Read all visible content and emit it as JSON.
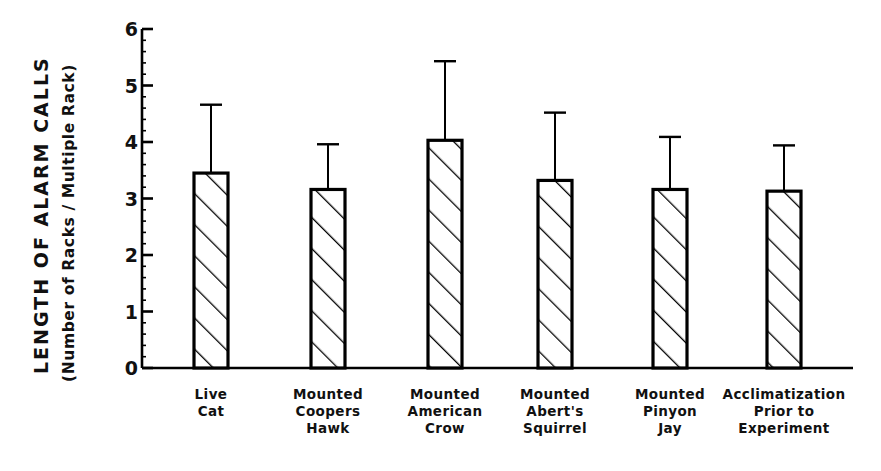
{
  "chart_data": {
    "type": "bar",
    "title": "",
    "ylabel": "LENGTH OF ALARM CALLS",
    "ylabel_sub": "(Number of Racks / Multiple Rack)",
    "xlabel": "",
    "ylim": [
      0,
      6
    ],
    "yticks": [
      0,
      1,
      2,
      3,
      4,
      5,
      6
    ],
    "ytick_labels": [
      "0",
      "1",
      "2",
      "3",
      "4",
      "5",
      "6"
    ],
    "minor_tick_interval": 0.2,
    "grid": false,
    "legend": null,
    "bar_style": {
      "fill": "#ffffff",
      "edge": "#000000",
      "hatch": "diagonal-45",
      "error_bars": "upper-only-with-cap"
    },
    "categories": [
      "Live Cat",
      "Mounted Coopers Hawk",
      "Mounted American Crow",
      "Mounted Abert's Squirrel",
      "Mounted Pinyon Jay",
      "Acclimatization Prior to Experiment"
    ],
    "category_lines": [
      [
        "Live",
        "Cat"
      ],
      [
        "Mounted",
        "Coopers",
        "Hawk"
      ],
      [
        "Mounted",
        "American",
        "Crow"
      ],
      [
        "Mounted",
        "Abert's",
        "Squirrel"
      ],
      [
        "Mounted",
        "Pinyon",
        "Jay"
      ],
      [
        "Acclimatization",
        "Prior to",
        "Experiment"
      ]
    ],
    "values": [
      3.45,
      3.16,
      4.03,
      3.32,
      3.16,
      3.13
    ],
    "error_upper": [
      4.66,
      3.96,
      5.43,
      4.52,
      4.09,
      3.94
    ],
    "series": [
      {
        "name": "Length of alarm calls",
        "values": [
          3.45,
          3.16,
          4.03,
          3.32,
          3.16,
          3.13
        ],
        "error_upper": [
          4.66,
          3.96,
          5.43,
          4.52,
          4.09,
          3.94
        ]
      }
    ]
  }
}
